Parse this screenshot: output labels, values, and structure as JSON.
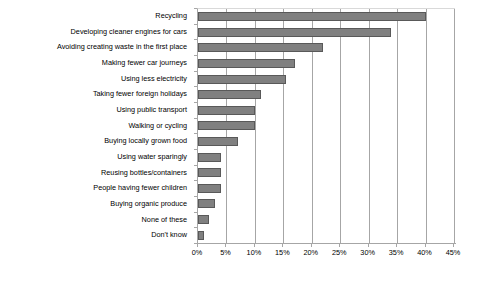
{
  "chart_data": {
    "type": "bar",
    "orientation": "horizontal",
    "title": "",
    "subtitle": "",
    "xlabel": "",
    "ylabel": "",
    "xlim": [
      0,
      45
    ],
    "ylim": null,
    "grid": true,
    "legend": null,
    "legend_position": "none",
    "value_suffix": "%",
    "xticks": [
      "0%",
      "5%",
      "10%",
      "15%",
      "20%",
      "25%",
      "30%",
      "35%",
      "40%",
      "45%"
    ],
    "xtick_values": [
      0,
      5,
      10,
      15,
      20,
      25,
      30,
      35,
      40,
      45
    ],
    "categories": [
      "Recycling",
      "Developing cleaner engines for cars",
      "Avoiding creating waste in the first place",
      "Making fewer car journeys",
      "Using less electricity",
      "Taking fewer foreign holidays",
      "Using public transport",
      "Walking or cycling",
      "Buying locally grown food",
      "Using water sparingly",
      "Reusing bottles/containers",
      "People having fewer children",
      "Buying organic produce",
      "None of these",
      "Don't know"
    ],
    "values": [
      40,
      34,
      22,
      17,
      15.5,
      11,
      10,
      10,
      7,
      4,
      4,
      4,
      3,
      2,
      1
    ],
    "series": [
      {
        "name": "Share of respondents",
        "values": [
          40,
          34,
          22,
          17,
          15.5,
          11,
          10,
          10,
          7,
          4,
          4,
          4,
          3,
          2,
          1
        ]
      }
    ],
    "colors": {
      "bar_fill": "#808080",
      "bar_border": "#595959",
      "gridline": "#a6a6a6",
      "axis": "#a6a6a6",
      "text": "#000000",
      "background": "#ffffff"
    }
  }
}
